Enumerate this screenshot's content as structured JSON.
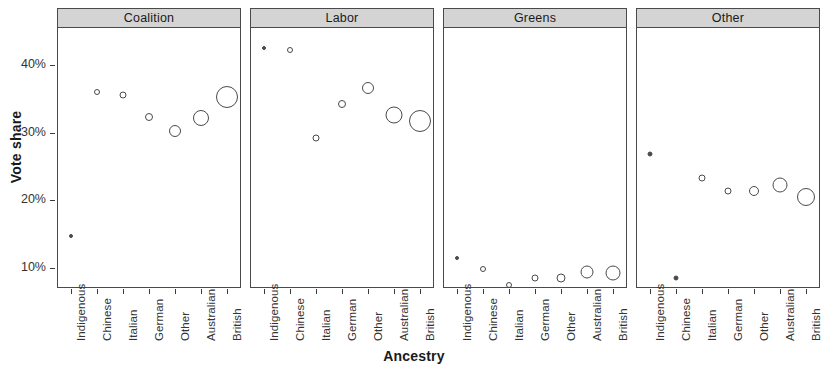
{
  "chart_data": {
    "type": "scatter",
    "title": "",
    "xlabel": "Ancestry",
    "ylabel": "Vote share",
    "categories": [
      "Indigenous",
      "Chinese",
      "Italian",
      "German",
      "Other",
      "Australian",
      "British"
    ],
    "ytick_labels": [
      "10%",
      "20%",
      "30%",
      "40%"
    ],
    "ytick_values": [
      10,
      20,
      30,
      40
    ],
    "ylim": [
      7.0,
      45.5
    ],
    "grid": false,
    "legend": null,
    "point_size_meaning": "Circle area scales with group population size",
    "panels": [
      {
        "label": "Coalition",
        "points": [
          {
            "category": "Indigenous",
            "value": 15.9,
            "size": 4
          },
          {
            "category": "Chinese",
            "value": 37.2,
            "size": 6
          },
          {
            "category": "Italian",
            "value": 36.8,
            "size": 7
          },
          {
            "category": "German",
            "value": 33.5,
            "size": 8
          },
          {
            "category": "Other",
            "value": 31.4,
            "size": 12
          },
          {
            "category": "Australian",
            "value": 33.4,
            "size": 16
          },
          {
            "category": "British",
            "value": 36.5,
            "size": 22
          }
        ]
      },
      {
        "label": "Labor",
        "points": [
          {
            "category": "Indigenous",
            "value": 43.7,
            "size": 4
          },
          {
            "category": "Chinese",
            "value": 43.5,
            "size": 6
          },
          {
            "category": "Italian",
            "value": 30.4,
            "size": 7
          },
          {
            "category": "German",
            "value": 35.4,
            "size": 8
          },
          {
            "category": "Other",
            "value": 37.8,
            "size": 12
          },
          {
            "category": "Australian",
            "value": 33.8,
            "size": 17
          },
          {
            "category": "British",
            "value": 32.9,
            "size": 22
          }
        ]
      },
      {
        "label": "Greens",
        "points": [
          {
            "category": "Indigenous",
            "value": 12.7,
            "size": 4
          },
          {
            "category": "Chinese",
            "value": 11.0,
            "size": 6
          },
          {
            "category": "Italian",
            "value": 8.6,
            "size": 6
          },
          {
            "category": "German",
            "value": 9.6,
            "size": 7
          },
          {
            "category": "Other",
            "value": 9.6,
            "size": 9
          },
          {
            "category": "Australian",
            "value": 10.5,
            "size": 13
          },
          {
            "category": "British",
            "value": 10.4,
            "size": 15
          }
        ]
      },
      {
        "label": "Other",
        "points": [
          {
            "category": "Indigenous",
            "value": 28.0,
            "size": 5
          },
          {
            "category": "Chinese",
            "value": 9.7,
            "size": 5
          },
          {
            "category": "Italian",
            "value": 24.5,
            "size": 7
          },
          {
            "category": "German",
            "value": 22.6,
            "size": 7
          },
          {
            "category": "Other",
            "value": 22.6,
            "size": 10
          },
          {
            "category": "Australian",
            "value": 23.5,
            "size": 15
          },
          {
            "category": "British",
            "value": 21.6,
            "size": 18
          }
        ]
      }
    ]
  }
}
